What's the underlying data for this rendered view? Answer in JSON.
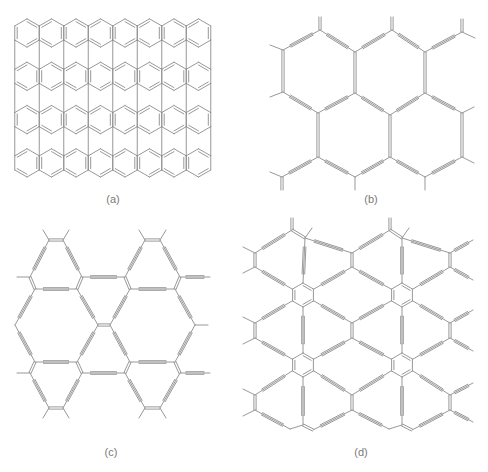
{
  "figure": {
    "background": "#ffffff",
    "line_color": "#8c8c8c",
    "panels": [
      {
        "id": "a",
        "label": "(a)",
        "label_pos": [
          113,
          200
        ],
        "description": "graphene-like fused hexagonal sheet (4 rows of 8 benzene rings)",
        "type": "graphene",
        "origin": [
          27,
          33
        ],
        "cols": 8,
        "rows": 4,
        "ring_w": 24.5,
        "row_h": 43.3
      },
      {
        "id": "b",
        "label": "(b)",
        "label_pos": [
          371,
          200
        ],
        "description": "graphdiyne-type network of large hexagons linked by diacetylene chains",
        "type": "bonds",
        "bonds": [
          [
            "t",
            283,
            50,
            320,
            30
          ],
          [
            "t",
            320,
            30,
            355,
            52
          ],
          [
            "t",
            355,
            52,
            392,
            30
          ],
          [
            "t",
            392,
            30,
            425,
            52
          ],
          [
            "t",
            425,
            52,
            462,
            32
          ],
          [
            "d",
            283,
            50,
            283,
            92
          ],
          [
            "d",
            355,
            52,
            355,
            93
          ],
          [
            "d",
            425,
            52,
            425,
            93
          ],
          [
            "t",
            283,
            92,
            318,
            113
          ],
          [
            "t",
            318,
            113,
            355,
            93
          ],
          [
            "t",
            355,
            93,
            390,
            115
          ],
          [
            "t",
            390,
            115,
            425,
            93
          ],
          [
            "t",
            425,
            93,
            462,
            113
          ],
          [
            "d",
            318,
            113,
            318,
            157
          ],
          [
            "d",
            390,
            115,
            390,
            157
          ],
          [
            "d",
            462,
            113,
            462,
            157
          ],
          [
            "t",
            282,
            177,
            318,
            157
          ],
          [
            "t",
            318,
            157,
            355,
            177
          ],
          [
            "t",
            355,
            177,
            390,
            157
          ],
          [
            "t",
            390,
            157,
            425,
            177
          ],
          [
            "t",
            425,
            177,
            462,
            157
          ],
          [
            "s",
            270,
            45,
            283,
            50
          ],
          [
            "s",
            270,
            97,
            283,
            92
          ],
          [
            "d",
            320,
            30,
            320,
            17
          ],
          [
            "d",
            392,
            30,
            392,
            17
          ],
          [
            "d",
            462,
            32,
            462,
            19
          ],
          [
            "s",
            462,
            32,
            475,
            38
          ],
          [
            "s",
            462,
            113,
            474,
            107
          ],
          [
            "s",
            462,
            157,
            474,
            163
          ],
          [
            "s",
            270,
            172,
            282,
            177
          ],
          [
            "d",
            282,
            177,
            282,
            190
          ],
          [
            "s",
            355,
            177,
            355,
            190
          ],
          [
            "s",
            425,
            177,
            425,
            190
          ]
        ]
      },
      {
        "id": "c",
        "label": "(c)",
        "label_pos": [
          111,
          453
        ],
        "description": "triangular graphyne-type network",
        "type": "bonds",
        "bonds": [
          [
            "d",
            49,
            240,
            63,
            240
          ],
          [
            "s",
            49,
            240,
            43,
            230
          ],
          [
            "s",
            63,
            240,
            69,
            230
          ],
          [
            "t",
            49,
            240,
            30,
            277
          ],
          [
            "t",
            63,
            240,
            82,
            277
          ],
          [
            "d",
            30,
            277,
            35,
            289
          ],
          [
            "d",
            82,
            277,
            77,
            289
          ],
          [
            "t",
            35,
            289,
            77,
            289
          ],
          [
            "s",
            30,
            277,
            17,
            277
          ],
          [
            "t",
            82,
            277,
            125,
            277
          ],
          [
            "d",
            145,
            240,
            160,
            240
          ],
          [
            "s",
            145,
            240,
            139,
            230
          ],
          [
            "s",
            160,
            240,
            166,
            230
          ],
          [
            "t",
            145,
            240,
            125,
            277
          ],
          [
            "t",
            160,
            240,
            180,
            277
          ],
          [
            "d",
            125,
            277,
            130,
            289
          ],
          [
            "d",
            180,
            277,
            175,
            289
          ],
          [
            "t",
            130,
            289,
            175,
            289
          ],
          [
            "t",
            180,
            277,
            210,
            277
          ],
          [
            "t",
            35,
            289,
            15,
            325
          ],
          [
            "t",
            77,
            289,
            98,
            325
          ],
          [
            "d",
            98,
            325,
            110,
            325
          ],
          [
            "t",
            110,
            325,
            130,
            289
          ],
          [
            "t",
            175,
            289,
            195,
            325
          ],
          [
            "s",
            195,
            325,
            208,
            325
          ],
          [
            "t",
            15,
            325,
            35,
            362
          ],
          [
            "t",
            98,
            325,
            77,
            362
          ],
          [
            "t",
            110,
            325,
            130,
            362
          ],
          [
            "t",
            195,
            325,
            175,
            362
          ],
          [
            "d",
            35,
            362,
            30,
            373
          ],
          [
            "d",
            77,
            362,
            82,
            373
          ],
          [
            "t",
            35,
            362,
            77,
            362
          ],
          [
            "d",
            130,
            362,
            125,
            373
          ],
          [
            "d",
            175,
            362,
            180,
            373
          ],
          [
            "t",
            130,
            362,
            175,
            362
          ],
          [
            "s",
            30,
            373,
            17,
            373
          ],
          [
            "t",
            82,
            373,
            125,
            373
          ],
          [
            "t",
            180,
            373,
            210,
            373
          ],
          [
            "t",
            30,
            373,
            49,
            408
          ],
          [
            "t",
            82,
            373,
            63,
            408
          ],
          [
            "d",
            49,
            408,
            63,
            408
          ],
          [
            "s",
            49,
            408,
            43,
            418
          ],
          [
            "s",
            63,
            408,
            69,
            418
          ],
          [
            "t",
            125,
            373,
            145,
            408
          ],
          [
            "t",
            180,
            373,
            160,
            408
          ],
          [
            "d",
            145,
            408,
            160,
            408
          ],
          [
            "s",
            145,
            408,
            139,
            418
          ],
          [
            "s",
            160,
            408,
            166,
            418
          ]
        ]
      },
      {
        "id": "d",
        "label": "(d)",
        "label_pos": [
          361,
          453
        ],
        "description": "benzene-node graphdiyne-type network",
        "type": "bonds",
        "rings": [
          [
            303,
            295
          ],
          [
            402,
            295
          ],
          [
            303,
            365
          ],
          [
            402,
            365
          ]
        ],
        "ring_r": 12,
        "bonds": [
          [
            "d",
            292,
            230,
            292,
            218
          ],
          [
            "s",
            305,
            238,
            312,
            228
          ],
          [
            "d",
            292,
            230,
            305,
            238
          ],
          [
            "d",
            390,
            230,
            390,
            218
          ],
          [
            "s",
            402,
            238,
            409,
            228
          ],
          [
            "d",
            390,
            230,
            402,
            238
          ],
          [
            "t",
            255,
            253,
            292,
            230
          ],
          [
            "t",
            305,
            238,
            352,
            253
          ],
          [
            "t",
            352,
            253,
            390,
            230
          ],
          [
            "t",
            402,
            238,
            450,
            253
          ],
          [
            "s",
            255,
            253,
            243,
            247
          ],
          [
            "d",
            255,
            253,
            255,
            267
          ],
          [
            "s",
            255,
            267,
            243,
            273
          ],
          [
            "d",
            352,
            253,
            352,
            267
          ],
          [
            "d",
            450,
            253,
            450,
            267
          ],
          [
            "t",
            450,
            253,
            473,
            240
          ],
          [
            "t",
            450,
            267,
            473,
            280
          ],
          [
            "t",
            305,
            238,
            303,
            283
          ],
          [
            "t",
            402,
            238,
            402,
            283
          ],
          [
            "t",
            255,
            267,
            292,
            289
          ],
          [
            "t",
            352,
            267,
            314,
            289
          ],
          [
            "t",
            352,
            267,
            391,
            289
          ],
          [
            "t",
            450,
            267,
            413,
            289
          ],
          [
            "t",
            292,
            301,
            255,
            323
          ],
          [
            "t",
            314,
            301,
            352,
            323
          ],
          [
            "t",
            391,
            301,
            352,
            323
          ],
          [
            "t",
            413,
            301,
            450,
            323
          ],
          [
            "s",
            255,
            323,
            243,
            317
          ],
          [
            "d",
            255,
            323,
            255,
            338
          ],
          [
            "s",
            255,
            338,
            243,
            344
          ],
          [
            "d",
            352,
            323,
            352,
            338
          ],
          [
            "d",
            450,
            323,
            450,
            338
          ],
          [
            "t",
            450,
            323,
            473,
            310
          ],
          [
            "t",
            450,
            338,
            473,
            351
          ],
          [
            "t",
            303,
            307,
            303,
            353
          ],
          [
            "t",
            402,
            307,
            402,
            353
          ],
          [
            "t",
            255,
            338,
            292,
            359
          ],
          [
            "t",
            352,
            338,
            314,
            359
          ],
          [
            "t",
            352,
            338,
            391,
            359
          ],
          [
            "t",
            450,
            338,
            413,
            359
          ],
          [
            "t",
            292,
            371,
            255,
            395
          ],
          [
            "t",
            314,
            371,
            352,
            395
          ],
          [
            "t",
            391,
            371,
            352,
            395
          ],
          [
            "t",
            413,
            371,
            450,
            395
          ],
          [
            "s",
            255,
            395,
            243,
            389
          ],
          [
            "d",
            255,
            395,
            255,
            410
          ],
          [
            "s",
            255,
            410,
            243,
            416
          ],
          [
            "d",
            352,
            395,
            352,
            410
          ],
          [
            "d",
            450,
            395,
            450,
            410
          ],
          [
            "t",
            450,
            395,
            473,
            383
          ],
          [
            "t",
            450,
            410,
            473,
            422
          ],
          [
            "t",
            303,
            377,
            303,
            425
          ],
          [
            "t",
            402,
            377,
            402,
            425
          ],
          [
            "t",
            255,
            410,
            290,
            429
          ],
          [
            "s",
            290,
            429,
            303,
            425
          ],
          [
            "d",
            303,
            425,
            313,
            430
          ],
          [
            "t",
            313,
            430,
            352,
            410
          ],
          [
            "t",
            352,
            410,
            389,
            429
          ],
          [
            "s",
            389,
            429,
            402,
            425
          ],
          [
            "d",
            402,
            425,
            412,
            430
          ],
          [
            "t",
            412,
            430,
            450,
            410
          ]
        ]
      }
    ]
  }
}
